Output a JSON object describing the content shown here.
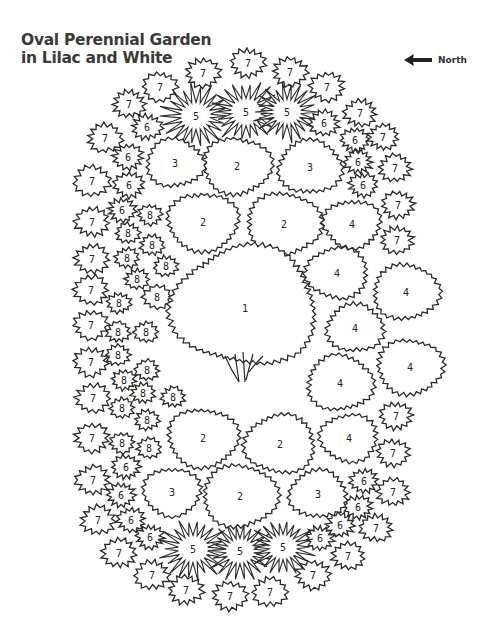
{
  "title": {
    "line1": "Oval Perennial Garden",
    "line2": "in Lilac and White"
  },
  "compass": {
    "label": "North",
    "icon": "arrow-left-icon"
  },
  "plants": [
    {
      "n": "1",
      "x": 245,
      "y": 312,
      "r": 68,
      "type": "tree"
    },
    {
      "n": "2",
      "x": 237,
      "y": 166,
      "r": 33,
      "type": "round"
    },
    {
      "n": "2",
      "x": 203,
      "y": 222,
      "r": 34,
      "type": "round"
    },
    {
      "n": "2",
      "x": 284,
      "y": 224,
      "r": 36,
      "type": "round"
    },
    {
      "n": "2",
      "x": 203,
      "y": 438,
      "r": 34,
      "type": "round"
    },
    {
      "n": "2",
      "x": 280,
      "y": 444,
      "r": 34,
      "type": "round"
    },
    {
      "n": "2",
      "x": 240,
      "y": 496,
      "r": 36,
      "type": "round"
    },
    {
      "n": "3",
      "x": 175,
      "y": 163,
      "r": 28,
      "type": "round"
    },
    {
      "n": "3",
      "x": 310,
      "y": 167,
      "r": 31,
      "type": "round"
    },
    {
      "n": "3",
      "x": 172,
      "y": 492,
      "r": 28,
      "type": "round"
    },
    {
      "n": "3",
      "x": 318,
      "y": 494,
      "r": 28,
      "type": "round"
    },
    {
      "n": "4",
      "x": 352,
      "y": 224,
      "r": 28,
      "type": "round"
    },
    {
      "n": "4",
      "x": 337,
      "y": 273,
      "r": 30,
      "type": "round"
    },
    {
      "n": "4",
      "x": 406,
      "y": 292,
      "r": 32,
      "type": "round"
    },
    {
      "n": "4",
      "x": 355,
      "y": 328,
      "r": 28,
      "type": "round"
    },
    {
      "n": "4",
      "x": 410,
      "y": 367,
      "r": 32,
      "type": "round"
    },
    {
      "n": "4",
      "x": 340,
      "y": 383,
      "r": 32,
      "type": "round"
    },
    {
      "n": "4",
      "x": 349,
      "y": 438,
      "r": 28,
      "type": "round"
    },
    {
      "n": "5",
      "x": 196,
      "y": 116,
      "r": 30,
      "type": "spiky"
    },
    {
      "n": "5",
      "x": 246,
      "y": 112,
      "r": 30,
      "type": "spiky"
    },
    {
      "n": "5",
      "x": 287,
      "y": 112,
      "r": 28,
      "type": "spiky"
    },
    {
      "n": "5",
      "x": 193,
      "y": 549,
      "r": 30,
      "type": "spiky"
    },
    {
      "n": "5",
      "x": 240,
      "y": 551,
      "r": 28,
      "type": "spiky"
    },
    {
      "n": "5",
      "x": 283,
      "y": 547,
      "r": 28,
      "type": "spiky"
    },
    {
      "n": "6",
      "x": 147,
      "y": 127,
      "r": 15,
      "type": "bush"
    },
    {
      "n": "6",
      "x": 128,
      "y": 157,
      "r": 15,
      "type": "bush"
    },
    {
      "n": "6",
      "x": 129,
      "y": 185,
      "r": 15,
      "type": "bush"
    },
    {
      "n": "6",
      "x": 122,
      "y": 210,
      "r": 14,
      "type": "bush"
    },
    {
      "n": "6",
      "x": 324,
      "y": 123,
      "r": 15,
      "type": "bush"
    },
    {
      "n": "6",
      "x": 355,
      "y": 140,
      "r": 14,
      "type": "bush"
    },
    {
      "n": "6",
      "x": 358,
      "y": 162,
      "r": 14,
      "type": "bush"
    },
    {
      "n": "6",
      "x": 363,
      "y": 185,
      "r": 14,
      "type": "bush"
    },
    {
      "n": "6",
      "x": 126,
      "y": 467,
      "r": 14,
      "type": "bush"
    },
    {
      "n": "6",
      "x": 121,
      "y": 495,
      "r": 14,
      "type": "bush"
    },
    {
      "n": "6",
      "x": 131,
      "y": 520,
      "r": 14,
      "type": "bush"
    },
    {
      "n": "6",
      "x": 150,
      "y": 537,
      "r": 14,
      "type": "bush"
    },
    {
      "n": "6",
      "x": 364,
      "y": 481,
      "r": 14,
      "type": "bush"
    },
    {
      "n": "6",
      "x": 358,
      "y": 507,
      "r": 14,
      "type": "bush"
    },
    {
      "n": "6",
      "x": 340,
      "y": 525,
      "r": 14,
      "type": "bush"
    },
    {
      "n": "6",
      "x": 320,
      "y": 538,
      "r": 14,
      "type": "bush"
    },
    {
      "n": "7",
      "x": 203,
      "y": 73,
      "r": 17,
      "type": "bush"
    },
    {
      "n": "7",
      "x": 248,
      "y": 63,
      "r": 17,
      "type": "bush"
    },
    {
      "n": "7",
      "x": 290,
      "y": 72,
      "r": 17,
      "type": "bush"
    },
    {
      "n": "7",
      "x": 160,
      "y": 87,
      "r": 17,
      "type": "bush"
    },
    {
      "n": "7",
      "x": 327,
      "y": 87,
      "r": 17,
      "type": "bush"
    },
    {
      "n": "7",
      "x": 129,
      "y": 104,
      "r": 16,
      "type": "bush"
    },
    {
      "n": "7",
      "x": 360,
      "y": 113,
      "r": 16,
      "type": "bush"
    },
    {
      "n": "7",
      "x": 105,
      "y": 138,
      "r": 17,
      "type": "bush"
    },
    {
      "n": "7",
      "x": 383,
      "y": 137,
      "r": 15,
      "type": "bush"
    },
    {
      "n": "7",
      "x": 92,
      "y": 181,
      "r": 18,
      "type": "bush"
    },
    {
      "n": "7",
      "x": 395,
      "y": 168,
      "r": 16,
      "type": "bush"
    },
    {
      "n": "7",
      "x": 92,
      "y": 222,
      "r": 17,
      "type": "bush"
    },
    {
      "n": "7",
      "x": 398,
      "y": 205,
      "r": 16,
      "type": "bush"
    },
    {
      "n": "7",
      "x": 92,
      "y": 259,
      "r": 17,
      "type": "bush"
    },
    {
      "n": "7",
      "x": 397,
      "y": 240,
      "r": 16,
      "type": "bush"
    },
    {
      "n": "7",
      "x": 91,
      "y": 290,
      "r": 17,
      "type": "bush"
    },
    {
      "n": "7",
      "x": 91,
      "y": 325,
      "r": 17,
      "type": "bush"
    },
    {
      "n": "7",
      "x": 91,
      "y": 362,
      "r": 17,
      "type": "bush"
    },
    {
      "n": "7",
      "x": 93,
      "y": 398,
      "r": 17,
      "type": "bush"
    },
    {
      "n": "7",
      "x": 396,
      "y": 416,
      "r": 16,
      "type": "bush"
    },
    {
      "n": "7",
      "x": 92,
      "y": 438,
      "r": 17,
      "type": "bush"
    },
    {
      "n": "7",
      "x": 393,
      "y": 453,
      "r": 16,
      "type": "bush"
    },
    {
      "n": "7",
      "x": 93,
      "y": 480,
      "r": 17,
      "type": "bush"
    },
    {
      "n": "7",
      "x": 393,
      "y": 492,
      "r": 16,
      "type": "bush"
    },
    {
      "n": "7",
      "x": 98,
      "y": 520,
      "r": 17,
      "type": "bush"
    },
    {
      "n": "7",
      "x": 376,
      "y": 528,
      "r": 16,
      "type": "bush"
    },
    {
      "n": "7",
      "x": 119,
      "y": 553,
      "r": 17,
      "type": "bush"
    },
    {
      "n": "7",
      "x": 348,
      "y": 556,
      "r": 16,
      "type": "bush"
    },
    {
      "n": "7",
      "x": 152,
      "y": 575,
      "r": 17,
      "type": "bush"
    },
    {
      "n": "7",
      "x": 313,
      "y": 575,
      "r": 17,
      "type": "bush"
    },
    {
      "n": "7",
      "x": 186,
      "y": 590,
      "r": 17,
      "type": "bush"
    },
    {
      "n": "7",
      "x": 230,
      "y": 596,
      "r": 17,
      "type": "bush"
    },
    {
      "n": "7",
      "x": 270,
      "y": 592,
      "r": 17,
      "type": "bush"
    },
    {
      "n": "8",
      "x": 150,
      "y": 215,
      "r": 12,
      "type": "small"
    },
    {
      "n": "8",
      "x": 128,
      "y": 233,
      "r": 12,
      "type": "small"
    },
    {
      "n": "8",
      "x": 152,
      "y": 245,
      "r": 12,
      "type": "small"
    },
    {
      "n": "8",
      "x": 127,
      "y": 258,
      "r": 12,
      "type": "small"
    },
    {
      "n": "8",
      "x": 166,
      "y": 266,
      "r": 12,
      "type": "small"
    },
    {
      "n": "8",
      "x": 137,
      "y": 279,
      "r": 12,
      "type": "small"
    },
    {
      "n": "8",
      "x": 157,
      "y": 297,
      "r": 14,
      "type": "small"
    },
    {
      "n": "8",
      "x": 119,
      "y": 303,
      "r": 12,
      "type": "small"
    },
    {
      "n": "8",
      "x": 118,
      "y": 332,
      "r": 12,
      "type": "small"
    },
    {
      "n": "8",
      "x": 146,
      "y": 332,
      "r": 12,
      "type": "small"
    },
    {
      "n": "8",
      "x": 118,
      "y": 355,
      "r": 12,
      "type": "small"
    },
    {
      "n": "8",
      "x": 147,
      "y": 370,
      "r": 12,
      "type": "small"
    },
    {
      "n": "8",
      "x": 124,
      "y": 380,
      "r": 12,
      "type": "small"
    },
    {
      "n": "8",
      "x": 143,
      "y": 393,
      "r": 12,
      "type": "small"
    },
    {
      "n": "8",
      "x": 173,
      "y": 397,
      "r": 12,
      "type": "small"
    },
    {
      "n": "8",
      "x": 122,
      "y": 408,
      "r": 12,
      "type": "small"
    },
    {
      "n": "8",
      "x": 147,
      "y": 420,
      "r": 12,
      "type": "small"
    },
    {
      "n": "8",
      "x": 122,
      "y": 443,
      "r": 12,
      "type": "small"
    },
    {
      "n": "8",
      "x": 149,
      "y": 448,
      "r": 12,
      "type": "small"
    }
  ],
  "colors": {
    "line": "#2b2b2b",
    "fill": "#ffffff",
    "text": "#222222"
  }
}
